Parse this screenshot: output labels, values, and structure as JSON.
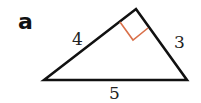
{
  "figure": {
    "label": "a",
    "shape": "right triangle",
    "right_angle_marker_color": "#d9704a",
    "line_color": "#111111",
    "sides": {
      "left": "4",
      "right": "3",
      "base": "5"
    },
    "vertices": {
      "left": [
        44,
        80
      ],
      "top": [
        136,
        9
      ],
      "right": [
        187,
        80
      ]
    }
  }
}
